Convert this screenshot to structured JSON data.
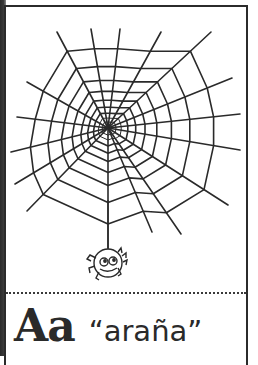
{
  "card": {
    "letter": "Aa",
    "word": "“araña”",
    "illustration": "spider-web-with-hanging-spider",
    "colors": {
      "ink": "#2a2a2a",
      "background": "#ffffff",
      "border": "#2b2b2b"
    }
  },
  "web": {
    "center": [
      108,
      128
    ],
    "strand_ends": [
      [
        57,
        32
      ],
      [
        91,
        29
      ],
      [
        120,
        29
      ],
      [
        161,
        32
      ],
      [
        211,
        32
      ],
      [
        232,
        78
      ],
      [
        240,
        114
      ],
      [
        240,
        150
      ],
      [
        228,
        205
      ],
      [
        181,
        234
      ],
      [
        152,
        232
      ],
      [
        108,
        248
      ],
      [
        27,
        211
      ],
      [
        15,
        184
      ],
      [
        11,
        152
      ],
      [
        17,
        117
      ],
      [
        27,
        82
      ]
    ]
  }
}
